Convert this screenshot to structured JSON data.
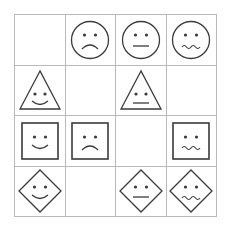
{
  "puzzle": {
    "rows": 4,
    "cols": 4,
    "line_color": "#b9b9b9",
    "stroke_color": "#3a3a3a",
    "cells": [
      [
        {
          "shape": "empty",
          "expression": "none"
        },
        {
          "shape": "circle",
          "expression": "sad"
        },
        {
          "shape": "circle",
          "expression": "neutral"
        },
        {
          "shape": "circle",
          "expression": "worried"
        }
      ],
      [
        {
          "shape": "triangle",
          "expression": "happy"
        },
        {
          "shape": "empty",
          "expression": "none"
        },
        {
          "shape": "triangle",
          "expression": "neutral"
        },
        {
          "shape": "empty",
          "expression": "none"
        }
      ],
      [
        {
          "shape": "square",
          "expression": "happy"
        },
        {
          "shape": "square",
          "expression": "sad"
        },
        {
          "shape": "empty",
          "expression": "none"
        },
        {
          "shape": "square",
          "expression": "worried"
        }
      ],
      [
        {
          "shape": "diamond",
          "expression": "happy"
        },
        {
          "shape": "empty",
          "expression": "none"
        },
        {
          "shape": "diamond",
          "expression": "neutral"
        },
        {
          "shape": "diamond",
          "expression": "worried"
        }
      ]
    ]
  }
}
